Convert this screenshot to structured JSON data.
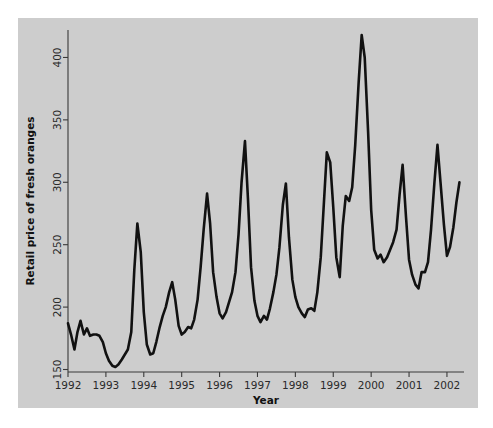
{
  "figure": {
    "background_color": "#ffffff",
    "panel_color": "#cdcdcd",
    "line_color": "#111111",
    "axis_color": "#3a3a3a"
  },
  "chart_data": {
    "type": "line",
    "title": "",
    "xlabel": "Year",
    "ylabel": "Retail price of fresh oranges",
    "xlim": [
      1992.0,
      2002.45
    ],
    "ylim": [
      148,
      422
    ],
    "grid": false,
    "legend": null,
    "xticks": [
      1992,
      1993,
      1994,
      1995,
      1996,
      1997,
      1998,
      1999,
      2000,
      2001,
      2002
    ],
    "xticklabels": [
      "1992",
      "1993",
      "1994",
      "1995",
      "1996",
      "1997",
      "1998",
      "1999",
      "2000",
      "2001",
      "2002"
    ],
    "yticks": [
      150,
      200,
      250,
      300,
      350,
      400
    ],
    "yticklabels": [
      "150",
      "200",
      "250",
      "300",
      "350",
      "400"
    ],
    "series": [
      {
        "name": "Retail price of fresh oranges",
        "x": [
          1992.0,
          1992.08,
          1992.17,
          1992.25,
          1992.33,
          1992.42,
          1992.5,
          1992.58,
          1992.67,
          1992.75,
          1992.83,
          1992.92,
          1993.0,
          1993.08,
          1993.17,
          1993.25,
          1993.33,
          1993.42,
          1993.5,
          1993.58,
          1993.67,
          1993.75,
          1993.83,
          1993.92,
          1994.0,
          1994.08,
          1994.17,
          1994.25,
          1994.33,
          1994.42,
          1994.5,
          1994.58,
          1994.67,
          1994.75,
          1994.83,
          1994.92,
          1995.0,
          1995.08,
          1995.17,
          1995.25,
          1995.33,
          1995.42,
          1995.5,
          1995.58,
          1995.67,
          1995.75,
          1995.83,
          1995.92,
          1996.0,
          1996.08,
          1996.17,
          1996.25,
          1996.33,
          1996.42,
          1996.5,
          1996.58,
          1996.67,
          1996.75,
          1996.83,
          1996.92,
          1997.0,
          1997.08,
          1997.17,
          1997.25,
          1997.33,
          1997.42,
          1997.5,
          1997.58,
          1997.67,
          1997.75,
          1997.83,
          1997.92,
          1998.0,
          1998.08,
          1998.17,
          1998.25,
          1998.33,
          1998.42,
          1998.5,
          1998.58,
          1998.67,
          1998.75,
          1998.83,
          1998.92,
          1999.0,
          1999.08,
          1999.17,
          1999.25,
          1999.33,
          1999.42,
          1999.5,
          1999.58,
          1999.67,
          1999.75,
          1999.83,
          1999.92,
          2000.0,
          2000.08,
          2000.17,
          2000.25,
          2000.33,
          2000.42,
          2000.5,
          2000.58,
          2000.67,
          2000.75,
          2000.83,
          2000.92,
          2001.0,
          2001.08,
          2001.17,
          2001.25,
          2001.33,
          2001.42,
          2001.5,
          2001.58,
          2001.67,
          2001.75,
          2001.83,
          2001.92,
          2002.0,
          2002.08,
          2002.17,
          2002.25,
          2002.33
        ],
        "y": [
          187,
          178,
          166,
          180,
          189,
          178,
          183,
          177,
          178,
          178,
          177,
          172,
          163,
          157,
          153,
          152,
          154,
          158,
          162,
          166,
          180,
          230,
          267,
          244,
          196,
          170,
          162,
          163,
          172,
          184,
          193,
          200,
          212,
          220,
          206,
          185,
          178,
          180,
          184,
          183,
          190,
          206,
          232,
          262,
          291,
          267,
          228,
          208,
          195,
          191,
          196,
          204,
          212,
          228,
          258,
          300,
          333,
          286,
          232,
          205,
          193,
          188,
          193,
          190,
          199,
          212,
          226,
          248,
          282,
          299,
          256,
          222,
          208,
          200,
          195,
          192,
          198,
          199,
          197,
          212,
          240,
          282,
          324,
          316,
          280,
          240,
          224,
          265,
          289,
          285,
          296,
          330,
          380,
          418,
          400,
          340,
          278,
          246,
          239,
          242,
          236,
          240,
          246,
          252,
          262,
          290,
          314,
          272,
          238,
          226,
          218,
          215,
          228,
          228,
          236,
          262,
          300,
          330,
          300,
          266,
          241,
          248,
          264,
          284,
          300
        ]
      }
    ]
  }
}
